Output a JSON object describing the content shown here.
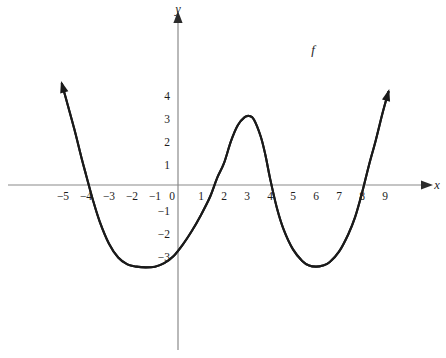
{
  "figure": {
    "background_color": "#ffffff",
    "axis_color": "#8a8a8a",
    "curve_color": "#1a1a1a",
    "text_color": "#1d1d1d"
  },
  "labels": {
    "x_axis_name": "x",
    "y_axis_name": "y",
    "curve_name": "f"
  },
  "chart_data": {
    "type": "line",
    "title": "",
    "subtitle": "",
    "xlabel": "x",
    "ylabel": "y",
    "grid": false,
    "legend_position": "inline-right",
    "xlim": [
      -5.8,
      9.8
    ],
    "ylim": [
      -4.6,
      4.9
    ],
    "x_ticks": [
      -5,
      -4,
      -3,
      -2,
      -1,
      0,
      1,
      2,
      3,
      4,
      5,
      6,
      7,
      8,
      9
    ],
    "x_tick_labels": [
      "−5",
      "−4",
      "−3",
      "−2",
      "−1",
      "0",
      "1",
      "2",
      "3",
      "4",
      "5",
      "6",
      "7",
      "8",
      "9"
    ],
    "y_ticks": [
      -3,
      -2,
      -1,
      1,
      2,
      3,
      4
    ],
    "y_tick_labels": [
      "−3",
      "−2",
      "−1",
      "1",
      "2",
      "3",
      "4"
    ],
    "series": [
      {
        "name": "f",
        "x": [
          -5.05,
          -4.8,
          -4.5,
          -4.2,
          -4.0,
          -3.7,
          -3.4,
          -3.0,
          -2.6,
          -2.2,
          -1.8,
          -1.4,
          -1.0,
          -0.6,
          -0.2,
          0.2,
          0.6,
          1.0,
          1.4,
          1.7,
          2.0,
          2.3,
          2.6,
          2.9,
          3.1,
          3.3,
          3.6,
          3.8,
          4.0,
          4.3,
          4.6,
          5.0,
          5.4,
          5.7,
          6.0,
          6.3,
          6.6,
          7.0,
          7.4,
          7.7,
          8.0,
          8.3,
          8.6,
          8.9,
          9.15
        ],
        "y": [
          4.4,
          3.5,
          2.4,
          1.2,
          0.45,
          -0.65,
          -1.6,
          -2.55,
          -3.15,
          -3.45,
          -3.55,
          -3.58,
          -3.55,
          -3.4,
          -3.1,
          -2.6,
          -2.0,
          -1.3,
          -0.5,
          0.3,
          0.95,
          1.9,
          2.6,
          2.95,
          3.0,
          2.85,
          2.1,
          1.3,
          0.3,
          -1.0,
          -1.95,
          -2.8,
          -3.3,
          -3.5,
          -3.55,
          -3.5,
          -3.35,
          -2.9,
          -2.15,
          -1.4,
          -0.35,
          0.85,
          1.95,
          3.15,
          4.05
        ],
        "zeros": [
          -4.1,
          1.9,
          4.1,
          8.15
        ],
        "local_minima": [
          {
            "x": -1.0,
            "y": -3.58
          },
          {
            "x": 6.0,
            "y": -3.55
          }
        ],
        "local_maxima": [
          {
            "x": 3.1,
            "y": 3.0
          }
        ],
        "endpoints_have_arrows": true
      }
    ]
  }
}
